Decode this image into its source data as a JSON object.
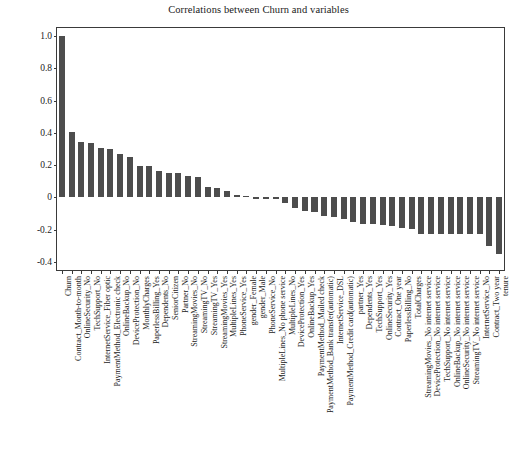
{
  "chart_data": {
    "type": "bar",
    "title": "Correlations between Churn and variables",
    "xlabel": "",
    "ylabel": "",
    "ylim": [
      -0.45,
      1.05
    ],
    "yticks": [
      "1.0",
      "0.8",
      "0.6",
      "0.4",
      "0.2",
      "0",
      "-0.2",
      "-0.4"
    ],
    "ytick_values": [
      1.0,
      0.8,
      0.6,
      0.4,
      0.2,
      0.0,
      -0.2,
      -0.4
    ],
    "grid": false,
    "legend": null,
    "bar_color": "#4d4d4d",
    "categories": [
      "Churn",
      "Contract_Month-to-month",
      "OnlineSecurity_No",
      "TechSupport_No",
      "InternetService_Fiber optic",
      "PaymentMethod_Electronic check",
      "OnlineBackup_No",
      "DeviceProtection_No",
      "MonthlyCharges",
      "PaperlessBilling_Yes",
      "Dependents_No",
      "SeniorCitizen",
      "Partner_No",
      "StreamingMovies_No",
      "StreamingTV_No",
      "StreamingTV_Yes",
      "StreamingMovies_Yes",
      "MultipleLines_Yes",
      "PhoneService_Yes",
      "gender_Female",
      "gender_Male",
      "PhoneService_No",
      "MultipleLines_No phone service",
      "MultipleLines_No",
      "DeviceProtection_Yes",
      "OnlineBackup_Yes",
      "PaymentMethod_Mailed check",
      "PaymentMethod_Bank transfer(automatic)",
      "InternetService_DSL",
      "PaymentMethod_Credit card(automatic)",
      "partner_Yes",
      "Dependents_Yes",
      "TechSupport_Yes",
      "OnlineSecurity_Yes",
      "Contract_One year",
      "PaperlessBilling_No",
      "TotalCharges",
      "StreamingMovies_No internet service",
      "DeviceProtection_No internet service",
      "TechSupport_No internet service",
      "OnlineBackup_No internet service",
      "OnlineSecurity_No internet service",
      "StreamingTV_No internet service",
      "InternetService_No",
      "Contract_Two year",
      "tenure"
    ],
    "values": [
      1.0,
      0.405,
      0.343,
      0.337,
      0.308,
      0.302,
      0.268,
      0.252,
      0.193,
      0.192,
      0.164,
      0.151,
      0.15,
      0.13,
      0.128,
      0.063,
      0.061,
      0.04,
      0.012,
      0.009,
      -0.009,
      -0.012,
      -0.012,
      -0.033,
      -0.066,
      -0.082,
      -0.091,
      -0.118,
      -0.124,
      -0.134,
      -0.15,
      -0.164,
      -0.165,
      -0.171,
      -0.178,
      -0.192,
      -0.199,
      -0.228,
      -0.228,
      -0.228,
      -0.228,
      -0.228,
      -0.228,
      -0.228,
      -0.302,
      -0.352
    ]
  }
}
